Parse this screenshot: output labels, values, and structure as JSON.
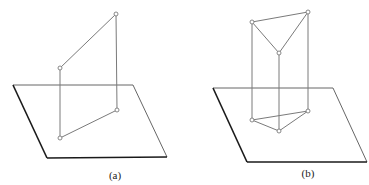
{
  "figures": [
    {
      "id": "a",
      "caption": "(a)",
      "description": "Parallelogram perpendicular to a plane with its projection",
      "plane": [
        [
          13,
          85
        ],
        [
          133,
          85
        ],
        [
          167,
          157
        ],
        [
          47,
          158
        ]
      ],
      "vertices": [
        [
          116,
          14
        ],
        [
          60,
          68
        ],
        [
          117,
          110
        ],
        [
          60,
          138
        ]
      ],
      "edges": [
        [
          0,
          1
        ],
        [
          0,
          2
        ],
        [
          1,
          3
        ],
        [
          3,
          2
        ]
      ],
      "caption_pos": [
        115,
        179
      ]
    },
    {
      "id": "b",
      "caption": "(b)",
      "description": "Triangular prism standing perpendicular on a plane",
      "plane": [
        [
          213,
          88
        ],
        [
          333,
          88
        ],
        [
          367,
          162
        ],
        [
          247,
          162
        ]
      ],
      "vertices": [
        [
          252,
          22
        ],
        [
          308,
          12
        ],
        [
          279,
          53
        ],
        [
          252,
          120
        ],
        [
          308,
          111
        ],
        [
          279,
          131
        ]
      ],
      "edges": [
        [
          0,
          1
        ],
        [
          0,
          2
        ],
        [
          1,
          2
        ],
        [
          0,
          3
        ],
        [
          1,
          4
        ],
        [
          2,
          5
        ],
        [
          3,
          4
        ],
        [
          3,
          5
        ],
        [
          4,
          5
        ]
      ],
      "caption_pos": [
        308,
        177
      ]
    }
  ]
}
